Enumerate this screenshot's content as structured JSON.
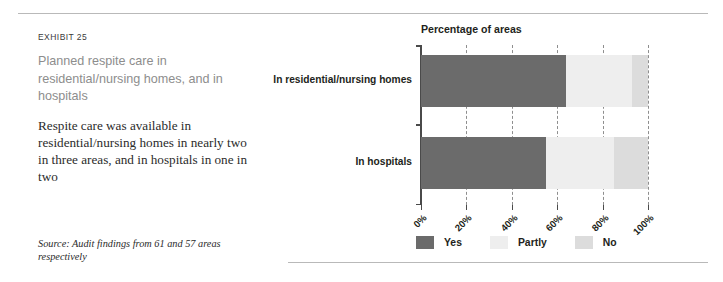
{
  "exhibit": {
    "label": "EXHIBIT 25",
    "heading": "Planned respite care in residential/nursing homes, and in hospitals",
    "body": "Respite care was available in residential/nursing homes in nearly two in three areas, and in hospitals in one in two",
    "source": "Source: Audit findings from 61 and 57 areas respectively"
  },
  "chart_data": {
    "type": "bar",
    "orientation": "horizontal",
    "stacked": true,
    "title": "Percentage of areas",
    "xlabel": "",
    "ylabel": "",
    "categories": [
      "In residential/nursing homes",
      "In hospitals"
    ],
    "series": [
      {
        "name": "Yes",
        "color": "#6b6b6b",
        "values": [
          64,
          55
        ]
      },
      {
        "name": "Partly",
        "color": "#eeeeee",
        "values": [
          29,
          30
        ]
      },
      {
        "name": "No",
        "color": "#dcdcdc",
        "values": [
          7,
          15
        ]
      }
    ],
    "xlim": [
      0,
      100
    ],
    "xticks": [
      0,
      20,
      40,
      60,
      80,
      100
    ],
    "xticklabels": [
      "0%",
      "20%",
      "40%",
      "60%",
      "80%",
      "100%"
    ],
    "grid": true,
    "legend_position": "bottom"
  },
  "colors": {
    "yes": "#6b6b6b",
    "partly": "#eeeeee",
    "no": "#dcdcdc",
    "rule": "#b9b9b9",
    "axis": "#4a4a4a",
    "heading": "#8d8d8d"
  }
}
